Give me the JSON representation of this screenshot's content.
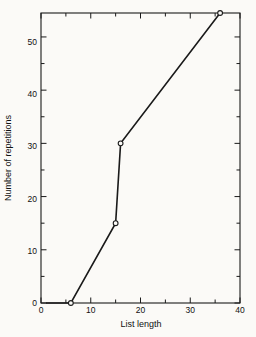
{
  "chart_data": {
    "type": "line",
    "title": "",
    "subtitle": "",
    "xlabel": "List length",
    "ylabel": "Number of repetitions",
    "xlim": [
      0,
      40
    ],
    "ylim": [
      0,
      54.5
    ],
    "xticks": [
      0,
      10,
      20,
      30,
      40
    ],
    "xticks_labels": [
      "0",
      "10",
      "20",
      "30",
      "40"
    ],
    "xminor_step": 5,
    "yticks": [
      0,
      10,
      20,
      30,
      40,
      50
    ],
    "yticks_labels": [
      "0",
      "10",
      "20",
      "30",
      "40",
      "50"
    ],
    "yminor_step": 5,
    "grid": false,
    "legend": null,
    "legend_position": "none",
    "frame": "box",
    "tick_direction": "in",
    "series": [
      {
        "name": "repetitions",
        "marker": "open-circle",
        "color": "#1a1a1a",
        "x": [
          1,
          6,
          15,
          16,
          36
        ],
        "y": [
          0,
          0,
          15,
          30,
          54.5
        ]
      }
    ],
    "annotations": []
  },
  "figure": {
    "background_color": "#fbfaf7",
    "line_color": "#1a1a1a",
    "text_color": "#111111"
  }
}
